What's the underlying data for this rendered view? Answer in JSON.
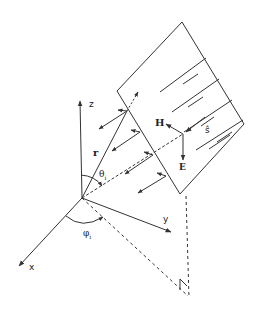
{
  "diagram": {
    "type": "plane-wave incident on flat plate geometry",
    "axes": {
      "x": "x",
      "y": "y",
      "z": "z"
    },
    "vectors": {
      "position": "r",
      "magnetic_field": "H",
      "electric_field": "E",
      "propagation": "ŝ",
      "incident_dir": "s"
    },
    "angles": {
      "theta": "θ",
      "theta_sub": "i",
      "phi": "φ",
      "phi_sub": "i"
    },
    "colors": {
      "line": "#333333",
      "background": "#ffffff"
    }
  }
}
